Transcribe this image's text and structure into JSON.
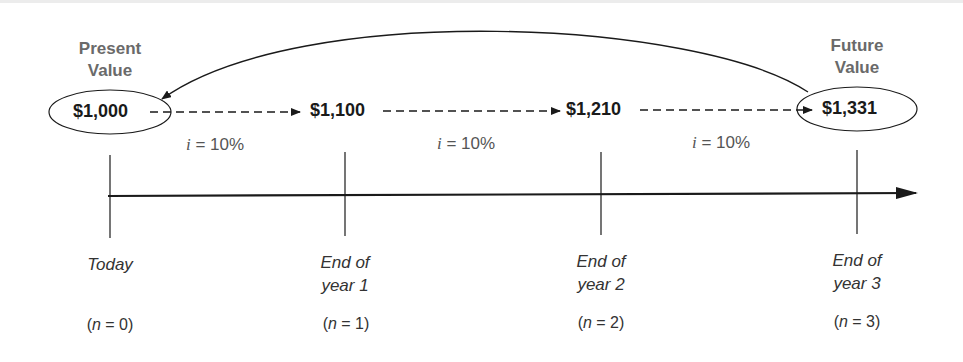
{
  "diagram": {
    "title_left": {
      "line1": "Present",
      "line2": "Value"
    },
    "title_right": {
      "line1": "Future",
      "line2": "Value"
    },
    "values": [
      "$1,000",
      "$1,100",
      "$1,210",
      "$1,331"
    ],
    "interest": [
      {
        "var": "i",
        "text": " = 10%"
      },
      {
        "var": "i",
        "text": " = 10%"
      },
      {
        "var": "i",
        "text": " = 10%"
      }
    ],
    "periods": [
      {
        "line1": "Today",
        "line2": "",
        "n_prefix": "(",
        "n_var": "n",
        "n_suffix": " = 0)"
      },
      {
        "line1": "End of",
        "line2": "year 1",
        "n_prefix": "(",
        "n_var": "n",
        "n_suffix": " = 1)"
      },
      {
        "line1": "End of",
        "line2": "year 2",
        "n_prefix": "(",
        "n_var": "n",
        "n_suffix": " = 2)"
      },
      {
        "line1": "End of",
        "line2": "year 3",
        "n_prefix": "(",
        "n_var": "n",
        "n_suffix": " = 3)"
      }
    ],
    "colors": {
      "line": "#1a1a1a",
      "heading": "#6a6a6a"
    }
  }
}
